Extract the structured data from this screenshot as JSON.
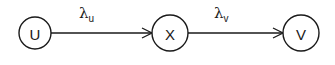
{
  "diagram": {
    "type": "flow",
    "stroke_color": "#1a1a1a",
    "background": "#ffffff",
    "nodes": [
      {
        "id": "U",
        "label": "U",
        "cx": 35,
        "cy": 33,
        "r": 16
      },
      {
        "id": "X",
        "label": "X",
        "cx": 170,
        "cy": 33,
        "r": 18
      },
      {
        "id": "V",
        "label": "V",
        "cx": 301,
        "cy": 33,
        "r": 18
      }
    ],
    "edges": [
      {
        "from": "U",
        "to": "X",
        "symbol": "λ",
        "subscript": "u",
        "label_x": 79,
        "label_y": 17
      },
      {
        "from": "X",
        "to": "V",
        "symbol": "λ",
        "subscript": "v",
        "label_x": 214,
        "label_y": 17
      }
    ]
  }
}
